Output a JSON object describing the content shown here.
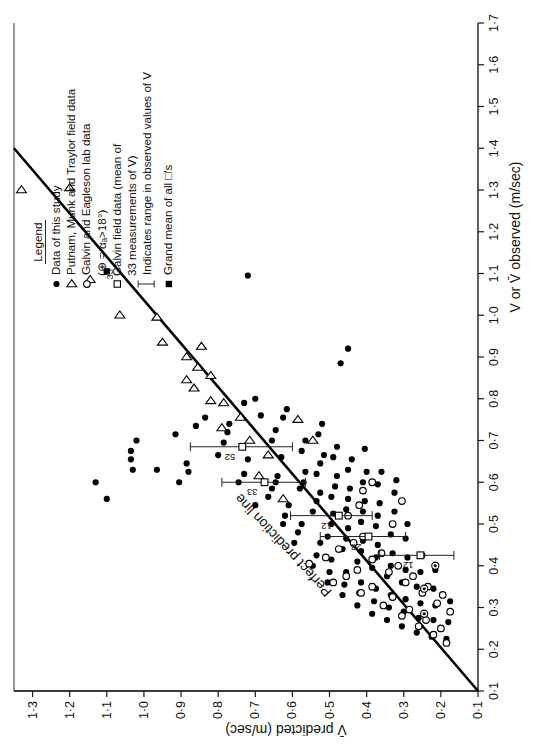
{
  "chart_data": {
    "type": "scatter",
    "title": "",
    "xlabel": "V or V̄ observed (m/sec)",
    "ylabel": "V̄ predicted (m/sec)",
    "xlim": [
      0.1,
      1.7
    ],
    "ylim": [
      0.1,
      1.35
    ],
    "xticks": [
      "0·1",
      "0·2",
      "0·3",
      "0·4",
      "0·5",
      "0·6",
      "0·7",
      "0·8",
      "0·9",
      "1·0",
      "1·1",
      "1·2",
      "1·3",
      "1·4",
      "1·5",
      "1·6",
      "1·7"
    ],
    "xtickvals": [
      0.1,
      0.2,
      0.3,
      0.4,
      0.5,
      0.6,
      0.7,
      0.8,
      0.9,
      1.0,
      1.1,
      1.2,
      1.3,
      1.4,
      1.5,
      1.6,
      1.7
    ],
    "yticks": [
      "0·1",
      "0·2",
      "0·3",
      "0·4",
      "0·5",
      "0·6",
      "0·7",
      "0·8",
      "0·9",
      "1·0",
      "1·1",
      "1·2",
      "1·3"
    ],
    "ytickvals": [
      0.1,
      0.2,
      0.3,
      0.4,
      0.5,
      0.6,
      0.7,
      0.8,
      0.9,
      1.0,
      1.1,
      1.2,
      1.3
    ],
    "grid": false,
    "legend_position": "upper-right",
    "annotations": [
      {
        "text": "Perfect prediction line",
        "x": 0.47,
        "y": 0.6
      }
    ],
    "reference_line": {
      "label": "Perfect prediction line",
      "from": [
        0.1,
        0.1
      ],
      "to": [
        1.4,
        1.35
      ]
    },
    "series": [
      {
        "name": "Data of this study",
        "marker": "filled-circle",
        "points": [
          [
            0.345,
            1.455
          ],
          [
            0.355,
            1.425
          ],
          [
            0.56,
            1.1
          ],
          [
            0.6,
            1.13
          ],
          [
            0.63,
            1.03
          ],
          [
            0.655,
            1.035
          ],
          [
            0.675,
            1.035
          ],
          [
            0.63,
            0.965
          ],
          [
            0.6,
            0.905
          ],
          [
            0.625,
            0.88
          ],
          [
            0.645,
            0.885
          ],
          [
            0.7,
            1.02
          ],
          [
            0.715,
            0.915
          ],
          [
            0.735,
            0.86
          ],
          [
            0.755,
            0.835
          ],
          [
            0.665,
            0.8
          ],
          [
            0.695,
            0.785
          ],
          [
            0.72,
            0.775
          ],
          [
            0.74,
            0.77
          ],
          [
            0.6,
            0.745
          ],
          [
            0.62,
            0.73
          ],
          [
            0.655,
            0.72
          ],
          [
            0.545,
            0.7
          ],
          [
            0.79,
            0.73
          ],
          [
            0.8,
            0.7
          ],
          [
            0.76,
            0.685
          ],
          [
            0.565,
            0.665
          ],
          [
            0.585,
            0.655
          ],
          [
            0.6,
            0.645
          ],
          [
            0.615,
            0.64
          ],
          [
            0.7,
            0.655
          ],
          [
            0.725,
            0.645
          ],
          [
            0.66,
            0.63
          ],
          [
            0.5,
            0.625
          ],
          [
            0.52,
            0.62
          ],
          [
            0.545,
            0.61
          ],
          [
            0.755,
            0.625
          ],
          [
            0.775,
            0.615
          ],
          [
            0.455,
            0.595
          ],
          [
            0.48,
            0.585
          ],
          [
            0.5,
            0.575
          ],
          [
            0.585,
            0.58
          ],
          [
            0.6,
            0.57
          ],
          [
            0.625,
            0.565
          ],
          [
            0.675,
            0.575
          ],
          [
            0.7,
            0.565
          ],
          [
            0.4,
            0.545
          ],
          [
            0.425,
            0.535
          ],
          [
            0.455,
            0.525
          ],
          [
            0.53,
            0.545
          ],
          [
            0.555,
            0.535
          ],
          [
            0.575,
            0.525
          ],
          [
            0.62,
            0.535
          ],
          [
            0.645,
            0.525
          ],
          [
            0.665,
            0.515
          ],
          [
            0.715,
            0.53
          ],
          [
            0.74,
            0.52
          ],
          [
            0.36,
            0.505
          ],
          [
            0.385,
            0.5
          ],
          [
            0.415,
            0.495
          ],
          [
            0.47,
            0.505
          ],
          [
            0.5,
            0.495
          ],
          [
            0.525,
            0.49
          ],
          [
            0.565,
            0.495
          ],
          [
            0.59,
            0.485
          ],
          [
            0.615,
            0.48
          ],
          [
            0.66,
            0.49
          ],
          [
            0.685,
            0.48
          ],
          [
            0.33,
            0.465
          ],
          [
            0.355,
            0.46
          ],
          [
            0.385,
            0.455
          ],
          [
            0.44,
            0.465
          ],
          [
            0.465,
            0.455
          ],
          [
            0.49,
            0.45
          ],
          [
            0.535,
            0.455
          ],
          [
            0.56,
            0.45
          ],
          [
            0.585,
            0.445
          ],
          [
            0.63,
            0.45
          ],
          [
            0.655,
            0.44
          ],
          [
            0.305,
            0.425
          ],
          [
            0.335,
            0.42
          ],
          [
            0.36,
            0.415
          ],
          [
            0.41,
            0.425
          ],
          [
            0.435,
            0.415
          ],
          [
            0.46,
            0.41
          ],
          [
            0.505,
            0.415
          ],
          [
            0.53,
            0.41
          ],
          [
            0.555,
            0.405
          ],
          [
            0.6,
            0.41
          ],
          [
            0.625,
            0.4
          ],
          [
            0.68,
            0.405
          ],
          [
            0.285,
            0.385
          ],
          [
            0.315,
            0.38
          ],
          [
            0.345,
            0.375
          ],
          [
            0.395,
            0.385
          ],
          [
            0.42,
            0.375
          ],
          [
            0.45,
            0.37
          ],
          [
            0.495,
            0.375
          ],
          [
            0.52,
            0.37
          ],
          [
            0.55,
            0.365
          ],
          [
            0.595,
            0.37
          ],
          [
            0.625,
            0.36
          ],
          [
            0.27,
            0.345
          ],
          [
            0.3,
            0.34
          ],
          [
            0.33,
            0.335
          ],
          [
            0.375,
            0.345
          ],
          [
            0.4,
            0.335
          ],
          [
            0.43,
            0.33
          ],
          [
            0.475,
            0.335
          ],
          [
            0.5,
            0.33
          ],
          [
            0.53,
            0.325
          ],
          [
            0.575,
            0.325
          ],
          [
            0.605,
            0.32
          ],
          [
            0.255,
            0.305
          ],
          [
            0.29,
            0.3
          ],
          [
            0.32,
            0.295
          ],
          [
            0.36,
            0.305
          ],
          [
            0.39,
            0.295
          ],
          [
            0.42,
            0.29
          ],
          [
            0.465,
            0.295
          ],
          [
            0.5,
            0.29
          ],
          [
            0.24,
            0.265
          ],
          [
            0.275,
            0.26
          ],
          [
            0.31,
            0.255
          ],
          [
            0.35,
            0.265
          ],
          [
            0.385,
            0.255
          ],
          [
            0.425,
            0.25
          ],
          [
            0.23,
            0.225
          ],
          [
            0.27,
            0.22
          ],
          [
            0.305,
            0.215
          ],
          [
            0.345,
            0.22
          ],
          [
            0.39,
            0.215
          ],
          [
            0.225,
            0.185
          ],
          [
            0.265,
            0.18
          ],
          [
            0.315,
            0.175
          ],
          [
            0.885,
            0.47
          ],
          [
            0.92,
            0.45
          ],
          [
            1.095,
            0.72
          ]
        ]
      },
      {
        "name": "Putnam, Munk and Traylor field data",
        "marker": "open-triangle",
        "points": [
          [
            1.3,
            1.33
          ],
          [
            1.305,
            1.2
          ],
          [
            1.085,
            1.145
          ],
          [
            1.0,
            1.065
          ],
          [
            0.995,
            0.965
          ],
          [
            0.935,
            0.95
          ],
          [
            0.9,
            0.885
          ],
          [
            0.925,
            0.845
          ],
          [
            0.875,
            0.855
          ],
          [
            0.855,
            0.82
          ],
          [
            0.845,
            0.885
          ],
          [
            0.825,
            0.865
          ],
          [
            0.795,
            0.82
          ],
          [
            0.79,
            0.785
          ],
          [
            0.755,
            0.74
          ],
          [
            0.73,
            0.79
          ],
          [
            0.7,
            0.715
          ],
          [
            0.665,
            0.665
          ],
          [
            0.615,
            0.69
          ],
          [
            0.56,
            0.625
          ],
          [
            0.75,
            0.585
          ],
          [
            0.7,
            0.545
          ]
        ]
      },
      {
        "name": "Galvin and Eagleson lab data",
        "marker": "open-circle",
        "points": [
          [
            0.405,
            0.555
          ],
          [
            0.42,
            0.51
          ],
          [
            0.44,
            0.475
          ],
          [
            0.36,
            0.49
          ],
          [
            0.375,
            0.455
          ],
          [
            0.39,
            0.425
          ],
          [
            0.455,
            0.435
          ],
          [
            0.47,
            0.41
          ],
          [
            0.335,
            0.415
          ],
          [
            0.35,
            0.385
          ],
          [
            0.415,
            0.385
          ],
          [
            0.43,
            0.36
          ],
          [
            0.305,
            0.355
          ],
          [
            0.325,
            0.33
          ],
          [
            0.385,
            0.34
          ],
          [
            0.4,
            0.315
          ],
          [
            0.28,
            0.305
          ],
          [
            0.295,
            0.285
          ],
          [
            0.36,
            0.295
          ],
          [
            0.375,
            0.275
          ],
          [
            0.255,
            0.26
          ],
          [
            0.27,
            0.24
          ],
          [
            0.335,
            0.25
          ],
          [
            0.35,
            0.235
          ],
          [
            0.235,
            0.22
          ],
          [
            0.25,
            0.2
          ],
          [
            0.31,
            0.21
          ],
          [
            0.33,
            0.195
          ],
          [
            0.215,
            0.185
          ],
          [
            0.29,
            0.175
          ],
          [
            0.52,
            0.45
          ],
          [
            0.545,
            0.42
          ],
          [
            0.58,
            0.41
          ],
          [
            0.6,
            0.385
          ],
          [
            0.5,
            0.33
          ],
          [
            0.555,
            0.305
          ]
        ]
      },
      {
        "name": "Galvin field data (mean of 33 measurements of V)",
        "marker": "open-square-with-errorbar",
        "points": [
          {
            "x": 0.6,
            "y": 0.675,
            "ylow": 0.565,
            "yhigh": 0.79,
            "label": "33"
          },
          {
            "x": 0.685,
            "y": 0.735,
            "ylow": 0.6,
            "yhigh": 0.875,
            "label": "52"
          },
          {
            "x": 0.52,
            "y": 0.475,
            "ylow": 0.385,
            "yhigh": 0.605,
            "label": "12"
          },
          {
            "x": 0.47,
            "y": 0.395,
            "ylow": 0.295,
            "yhigh": 0.525,
            "label": "28"
          },
          {
            "x": 0.425,
            "y": 0.255,
            "ylow": 0.165,
            "yhigh": 0.365,
            "label": "12"
          }
        ]
      },
      {
        "name": "Grand mean of all squares",
        "marker": "filled-square",
        "points": [
          [
            1.105,
            1.1
          ]
        ]
      }
    ]
  },
  "legend": {
    "title": "Legend",
    "entries": [
      {
        "marker": "filled-circle",
        "label": "Data of this study"
      },
      {
        "marker": "open-triangle",
        "label": "Putnam, Munk and Traylor field data"
      },
      {
        "marker": "open-circle",
        "label": "Galvin and Eagleson lab data"
      },
      {
        "marker": "none",
        "label": "(⊕ = αₐ>18°)"
      },
      {
        "marker": "open-square",
        "label": "Galvin field data (mean of"
      },
      {
        "marker": "none",
        "label": "33 measurements of V)"
      },
      {
        "marker": "vertical-bar",
        "label": "Indicates range in observed values of V"
      },
      {
        "marker": "filled-square",
        "label": "Grand mean of all   □'s"
      }
    ],
    "superscript_33": "33"
  },
  "axes": {
    "x_title": "V or V̄ observed  (m/sec)",
    "y_title": "V̄ predicted  (m/sec)"
  },
  "colors": {
    "ink": "#111111",
    "line": "#000000",
    "background": "#ffffff"
  }
}
